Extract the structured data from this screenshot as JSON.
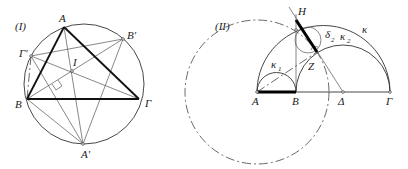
{
  "figures": [
    {
      "id": "I",
      "title": "(I)",
      "labels": {
        "A": "A",
        "B": "B",
        "G": "Γ",
        "Ap": "A'",
        "Bp": "B'",
        "Gp": "Γ'",
        "I": "I"
      }
    },
    {
      "id": "II",
      "title": "(II)",
      "labels": {
        "A": "A",
        "B": "B",
        "D": "Δ",
        "G": "Γ",
        "H": "H",
        "Z": "Z",
        "k": "κ",
        "k1": "κ",
        "k1_sub": "1",
        "k2": "κ",
        "k2_sub": "2",
        "d2": "δ",
        "d2_sub": "2"
      }
    }
  ]
}
